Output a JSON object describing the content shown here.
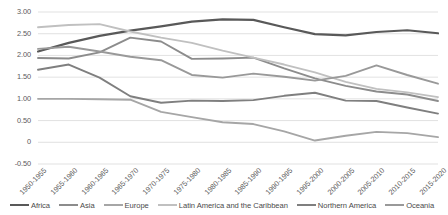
{
  "chart_data": {
    "type": "line",
    "title": "",
    "xlabel": "",
    "ylabel": "",
    "ylim": [
      -0.5,
      3.0
    ],
    "grid": true,
    "legend_position": "bottom",
    "y_ticks": [
      "3.00",
      "2.50",
      "2.00",
      "1.50",
      "1.00",
      "0.50",
      "0",
      "-0.50"
    ],
    "y_tick_values": [
      3.0,
      2.5,
      2.0,
      1.5,
      1.0,
      0.5,
      0,
      -0.5
    ],
    "categories": [
      "1950-1955",
      "1955-1960",
      "1960-1965",
      "1965-1970",
      "1970-1975",
      "1975-1980",
      "1980-1985",
      "1985-1990",
      "1990-1995",
      "1995-2000",
      "2000-2005",
      "2005-2010",
      "2010-2015",
      "2015-2020"
    ],
    "series": [
      {
        "name": "Africa",
        "color": "#595959",
        "width": 2.2,
        "values": [
          2.09,
          2.29,
          2.45,
          2.57,
          2.67,
          2.78,
          2.83,
          2.82,
          2.65,
          2.49,
          2.46,
          2.54,
          2.58,
          2.51
        ]
      },
      {
        "name": "Asia",
        "color": "#8c8c8c",
        "width": 1.9,
        "values": [
          1.94,
          1.93,
          2.07,
          2.41,
          2.32,
          1.92,
          1.93,
          1.95,
          1.7,
          1.47,
          1.3,
          1.17,
          1.1,
          0.95
        ]
      },
      {
        "name": "Europe",
        "color": "#a6a6a6",
        "width": 1.9,
        "values": [
          1.0,
          1.0,
          0.99,
          0.98,
          0.7,
          0.58,
          0.46,
          0.42,
          0.25,
          0.04,
          0.15,
          0.24,
          0.21,
          0.12
        ]
      },
      {
        "name": "Latin America and the Caribbean",
        "color": "#c0c0c0",
        "width": 1.9,
        "values": [
          2.65,
          2.7,
          2.72,
          2.55,
          2.41,
          2.29,
          2.11,
          1.95,
          1.79,
          1.61,
          1.39,
          1.23,
          1.15,
          1.04
        ]
      },
      {
        "name": "Northern America",
        "color": "#7f7f7f",
        "width": 1.9,
        "values": [
          1.67,
          1.79,
          1.49,
          1.06,
          0.91,
          0.96,
          0.95,
          0.97,
          1.07,
          1.14,
          0.96,
          0.95,
          0.8,
          0.66
        ]
      },
      {
        "name": "Oceania",
        "color": "#999999",
        "width": 1.9,
        "values": [
          2.15,
          2.2,
          2.09,
          1.97,
          1.89,
          1.55,
          1.49,
          1.58,
          1.51,
          1.42,
          1.53,
          1.77,
          1.55,
          1.35
        ]
      }
    ]
  }
}
